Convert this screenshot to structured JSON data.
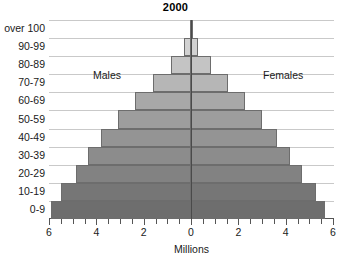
{
  "chart_data": {
    "type": "bar",
    "subtype": "population-pyramid",
    "title": "2000",
    "xlabel": "Millions",
    "ylabel": "",
    "categories": [
      "0-9",
      "10-19",
      "20-29",
      "30-39",
      "40-49",
      "50-59",
      "60-69",
      "70-79",
      "80-89",
      "90-99",
      "over 100"
    ],
    "x_tick_labels": [
      "6",
      "4",
      "2",
      "0",
      "2",
      "4",
      "6"
    ],
    "x_tick_values": [
      -6,
      -4,
      -2,
      0,
      2,
      4,
      6
    ],
    "xlim": [
      -6,
      6
    ],
    "grid": true,
    "legend_position": "inline",
    "series": [
      {
        "name": "Males",
        "side": "left",
        "values": [
          5.9,
          5.5,
          4.85,
          4.35,
          3.8,
          3.1,
          2.35,
          1.6,
          0.85,
          0.3,
          0.06
        ]
      },
      {
        "name": "Females",
        "side": "right",
        "values": [
          5.65,
          5.3,
          4.7,
          4.2,
          3.65,
          3.0,
          2.3,
          1.55,
          0.85,
          0.3,
          0.06
        ]
      }
    ],
    "annotations": [
      {
        "name": "males-label",
        "text": "Males"
      },
      {
        "name": "females-label",
        "text": "Females"
      }
    ],
    "colors": {
      "bar_outline": "#6d6d6d",
      "axis": "#555555",
      "gridline": "#c9c9c9",
      "center_line": "#4a4a4a",
      "text": "#1a1a1a",
      "background": "#ffffff",
      "band_fills": [
        "#6e6e6e",
        "#767676",
        "#828282",
        "#8c8c8c",
        "#949494",
        "#9d9d9d",
        "#a8a8a8",
        "#b6b6b6",
        "#c4c4c4",
        "#d2d2d2",
        "#d8d8d8"
      ]
    }
  }
}
